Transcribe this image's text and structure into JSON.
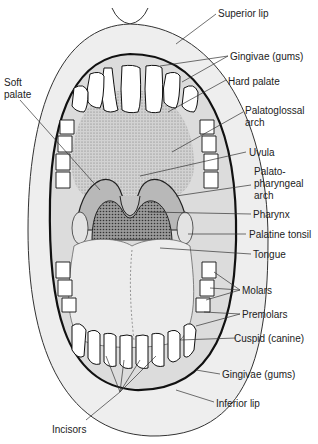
{
  "figure": {
    "colors": {
      "lip": "#eeeeee",
      "gum": "#e6e6e6",
      "palate": "#c9c9c9",
      "pharynx": "#8f8f8f",
      "tongue": "#e9e9e9",
      "teeth": "#ffffff",
      "outline": "#1a1a1a",
      "leader": "#333333"
    }
  },
  "labels": [
    {
      "id": "superior-lip",
      "text": "Superior lip"
    },
    {
      "id": "gingivae-upper",
      "text": "Gingivae (gums)"
    },
    {
      "id": "hard-palate",
      "text": "Hard palate"
    },
    {
      "id": "soft-palate-1",
      "text": "Soft"
    },
    {
      "id": "soft-palate-2",
      "text": "palate"
    },
    {
      "id": "palatoglossal-1",
      "text": "Palatoglossal"
    },
    {
      "id": "palatoglossal-2",
      "text": "arch"
    },
    {
      "id": "uvula",
      "text": "Uvula"
    },
    {
      "id": "palatopharyngeal-1",
      "text": "Palato-"
    },
    {
      "id": "palatopharyngeal-2",
      "text": "pharyngeal"
    },
    {
      "id": "palatopharyngeal-3",
      "text": "arch"
    },
    {
      "id": "pharynx",
      "text": "Pharynx"
    },
    {
      "id": "palatine-tonsil",
      "text": "Palatine tonsil"
    },
    {
      "id": "tongue",
      "text": "Tongue"
    },
    {
      "id": "molars",
      "text": "Molars"
    },
    {
      "id": "premolars",
      "text": "Premolars"
    },
    {
      "id": "cuspid",
      "text": "Cuspid (canine)"
    },
    {
      "id": "gingivae-lower",
      "text": "Gingivae (gums)"
    },
    {
      "id": "inferior-lip",
      "text": "Inferior lip"
    },
    {
      "id": "incisors",
      "text": "Incisors"
    }
  ]
}
